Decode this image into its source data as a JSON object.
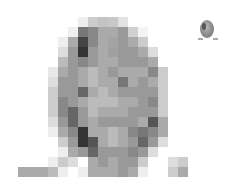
{
  "image": {
    "description": "Pixelated grayscale mosaic of an oval (egg/face-like) shape with a small thumbnail of the same shape in the top-right corner",
    "mosaic": {
      "cell_size": 10,
      "origin": [
        18,
        17
      ],
      "rows": [
        [
          "fff",
          "fff",
          "fff",
          "fff",
          "fff",
          "fff",
          "eee",
          "ccc",
          "c4c4c4",
          "c8c8c8",
          "e2e2e2",
          "fff",
          "fff",
          "fff",
          "fff",
          "fff",
          "fff"
        ],
        [
          "fff",
          "fff",
          "fff",
          "fff",
          "fff",
          "f0f0f0",
          "777",
          "888",
          "aaa",
          "aaa",
          "999",
          "d0d0d0",
          "f4f4f4",
          "fff",
          "fff",
          "fff",
          "fff"
        ],
        [
          "fff",
          "fff",
          "fff",
          "fff",
          "eee",
          "aaa",
          "444",
          "888",
          "aaa",
          "a4a4a4",
          "999",
          "aaa",
          "ccc",
          "fff",
          "fff",
          "fff",
          "fff"
        ],
        [
          "fff",
          "fff",
          "fff",
          "fff",
          "ddd",
          "999",
          "333",
          "999",
          "aaa",
          "a0a0a0",
          "999",
          "999",
          "aaa",
          "ddd",
          "fff",
          "fff",
          "fff"
        ],
        [
          "fff",
          "fff",
          "fff",
          "fff",
          "bbb",
          "999",
          "888",
          "999",
          "aaa",
          "aaa",
          "999",
          "999",
          "999",
          "aaa",
          "fff",
          "fff",
          "fff"
        ],
        [
          "fff",
          "fff",
          "fff",
          "e8e8e8",
          "aaa",
          "999",
          "aaa",
          "bbb",
          "aaa",
          "999",
          "aaa",
          "aaa",
          "aaa",
          "888",
          "ccc",
          "fff",
          "fff"
        ],
        [
          "fff",
          "fff",
          "fff",
          "ddd",
          "999",
          "999",
          "aaa",
          "bbb",
          "aaa",
          "aaa",
          "777",
          "aaa",
          "999",
          "aaa",
          "ccc",
          "fff",
          "fff"
        ],
        [
          "fff",
          "fff",
          "fff",
          "ccc",
          "999",
          "999",
          "666",
          "aaa",
          "bbb",
          "aaa",
          "999",
          "999",
          "999",
          "999",
          "ccc",
          "fff",
          "fff"
        ],
        [
          "fff",
          "fff",
          "fff",
          "ccc",
          "888",
          "999",
          "aaa",
          "bbb",
          "bbb",
          "bbb",
          "aaa",
          "aaa",
          "999",
          "888",
          "ccc",
          "fff",
          "fff"
        ],
        [
          "fff",
          "fff",
          "fff",
          "ccc",
          "888",
          "666",
          "999",
          "bbb",
          "aaa",
          "aaa",
          "aaa",
          "999",
          "999",
          "999",
          "ccc",
          "fff",
          "fff"
        ],
        [
          "fff",
          "fff",
          "fff",
          "ddd",
          "999",
          "666",
          "999",
          "aaa",
          "999",
          "999",
          "999",
          "999",
          "aaa",
          "555",
          "aaa",
          "fff",
          "fff"
        ],
        [
          "fff",
          "fff",
          "fff",
          "eee",
          "aaa",
          "888",
          "333",
          "aaa",
          "aaa",
          "bbb",
          "aaa",
          "888",
          "777",
          "888",
          "aaa",
          "fff",
          "fff"
        ],
        [
          "fff",
          "fff",
          "fff",
          "fff",
          "ccc",
          "999",
          "333",
          "555",
          "aaa",
          "bbb",
          "aaa",
          "999",
          "666",
          "999",
          "ddd",
          "fff",
          "fff"
        ],
        [
          "fff",
          "fff",
          "fff",
          "fff",
          "eee",
          "aaa",
          "999",
          "666",
          "999",
          "999",
          "999",
          "888",
          "999",
          "ddd",
          "fff",
          "fff",
          "fff"
        ],
        [
          "fff",
          "fff",
          "fff",
          "eee",
          "ccc",
          "ddd",
          "fff",
          "aaa",
          "999",
          "aaa",
          "999",
          "999",
          "ccc",
          "fff",
          "fff",
          "ddd",
          "ccc"
        ],
        [
          "aaa",
          "aaa",
          "aaa",
          "bbb",
          "eee",
          "fff",
          "eee",
          "aaa",
          "aaa",
          "aaa",
          "999",
          "aaa",
          "eee",
          "fff",
          "fff",
          "ccc",
          "aaa"
        ]
      ]
    },
    "thumbnail": {
      "position": [
        198,
        20
      ],
      "size": [
        20,
        22
      ]
    }
  }
}
